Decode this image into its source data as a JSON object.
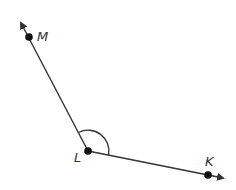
{
  "diagram": {
    "type": "angle",
    "angle_name": "MLK",
    "vertex": {
      "label": "L",
      "x": 88,
      "y": 151
    },
    "rays": [
      {
        "from": "L",
        "through": "M",
        "point": {
          "label": "M",
          "x": 29,
          "y": 37
        },
        "arrow_tip": {
          "x": 20,
          "y": 21
        }
      },
      {
        "from": "L",
        "through": "K",
        "point": {
          "label": "K",
          "x": 208,
          "y": 175
        },
        "arrow_tip": {
          "x": 225,
          "y": 178
        }
      }
    ],
    "angle_mark": "arc",
    "colors": {
      "line": "#333333",
      "point": "#111111",
      "background": "#ffffff"
    }
  },
  "labels": {
    "m": "M",
    "l": "L",
    "k": "K"
  }
}
